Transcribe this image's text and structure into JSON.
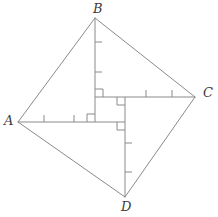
{
  "figure": {
    "name": "quadrilateral-abcd-with-perpendicular-diagonal-segments",
    "width": 218,
    "height": 217,
    "background_color": "#ffffff",
    "stroke_color": "#8a8a8a",
    "label_color": "#3c3c3c",
    "stroke_width": 1,
    "labels": {
      "A": "A",
      "B": "B",
      "C": "C",
      "D": "D"
    },
    "vertices": {
      "A": {
        "x": 18,
        "y": 122
      },
      "B": {
        "x": 95,
        "y": 18
      },
      "C": {
        "x": 195,
        "y": 97
      },
      "D": {
        "x": 125,
        "y": 197
      }
    },
    "label_positions": {
      "A": {
        "x": 4,
        "y": 114
      },
      "B": {
        "x": 93,
        "y": 2
      },
      "C": {
        "x": 203,
        "y": 86
      },
      "D": {
        "x": 121,
        "y": 200
      }
    },
    "outline_edges": [
      {
        "name": "edge-AB",
        "from": "A",
        "to": "B"
      },
      {
        "name": "edge-BC",
        "from": "B",
        "to": "C"
      },
      {
        "name": "edge-CD",
        "from": "C",
        "to": "D"
      },
      {
        "name": "edge-DA",
        "from": "D",
        "to": "A"
      }
    ],
    "inner_segments": [
      {
        "name": "segment-B-foot",
        "from_label": "B",
        "x1": 95,
        "y1": 18,
        "x2": 95,
        "y2": 122,
        "orientation": "vertical",
        "tick_count": 2,
        "tick_positions": [
          {
            "x": 95,
            "y": 42
          },
          {
            "x": 95,
            "y": 72
          }
        ]
      },
      {
        "name": "segment-A-foot",
        "from_label": "A",
        "x1": 18,
        "y1": 122,
        "x2": 125,
        "y2": 122,
        "orientation": "horizontal",
        "tick_count": 2,
        "tick_positions": [
          {
            "x": 44,
            "y": 122
          },
          {
            "x": 74,
            "y": 122
          }
        ]
      },
      {
        "name": "segment-C-foot",
        "from_label": "C",
        "x1": 95,
        "y1": 97,
        "x2": 195,
        "y2": 97,
        "orientation": "horizontal",
        "tick_count": 2,
        "tick_positions": [
          {
            "x": 146,
            "y": 97
          },
          {
            "x": 172,
            "y": 97
          }
        ]
      },
      {
        "name": "segment-D-foot",
        "from_label": "D",
        "x1": 125,
        "y1": 97,
        "x2": 125,
        "y2": 197,
        "orientation": "vertical",
        "tick_count": 2,
        "tick_positions": [
          {
            "x": 125,
            "y": 143
          },
          {
            "x": 125,
            "y": 172
          }
        ]
      }
    ],
    "right_angle_marks": [
      {
        "name": "right-angle-upper-left",
        "x": 95,
        "y": 97,
        "dx": 1,
        "dy": -1,
        "size": 8
      },
      {
        "name": "right-angle-upper-right",
        "x": 125,
        "y": 97,
        "dx": -1,
        "dy": 1,
        "size": 8
      },
      {
        "name": "right-angle-lower-left",
        "x": 95,
        "y": 122,
        "dx": -1,
        "dy": -1,
        "size": 8
      },
      {
        "name": "right-angle-lower-right",
        "x": 125,
        "y": 122,
        "dx": -1,
        "dy": 1,
        "size": 8
      }
    ],
    "tick_length": 7
  }
}
